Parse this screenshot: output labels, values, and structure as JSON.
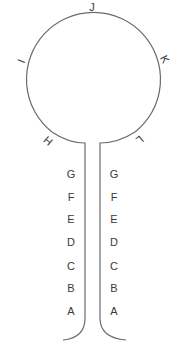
{
  "diagram": {
    "type": "hairpin-loop",
    "colors": {
      "stroke": "#6b6b6b",
      "text": "#3a3a3a",
      "background": "#ffffff"
    },
    "loop_labels": [
      {
        "id": "H",
        "text": "H"
      },
      {
        "id": "I",
        "text": "I"
      },
      {
        "id": "J",
        "text": "J"
      },
      {
        "id": "K",
        "text": "K"
      },
      {
        "id": "L",
        "text": "L"
      }
    ],
    "stem_left": [
      "G",
      "F",
      "E",
      "D",
      "C",
      "B",
      "A"
    ],
    "stem_right": [
      "G",
      "F",
      "E",
      "D",
      "C",
      "B",
      "A"
    ]
  }
}
